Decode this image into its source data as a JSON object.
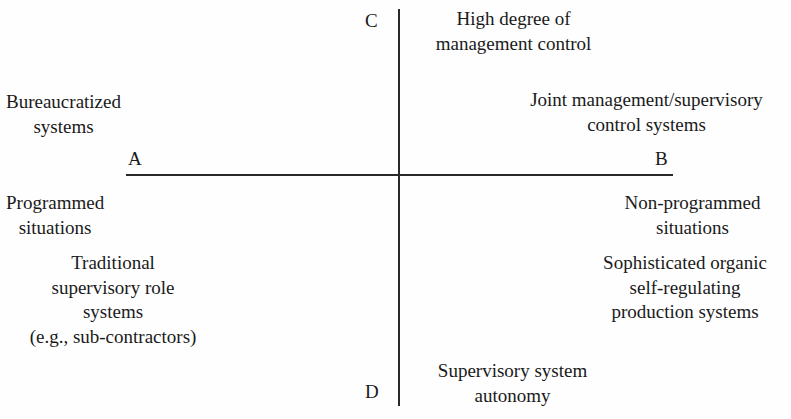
{
  "figure": {
    "type": "two-by-two-matrix-diagram",
    "axes": {
      "vertical": {
        "top_letter": "C",
        "bottom_letter": "D",
        "top_label_lines": [
          "High degree of",
          "management control"
        ],
        "bottom_label_lines": [
          "Supervisory system",
          "autonomy"
        ]
      },
      "horizontal": {
        "left_letter": "A",
        "right_letter": "B",
        "left_label_lines": [
          "Programmed",
          "situations"
        ],
        "right_label_lines": [
          "Non-programmed",
          "situations"
        ]
      }
    },
    "quadrants": {
      "top_left": {
        "lines": [
          "Bureaucratized",
          "systems"
        ]
      },
      "top_right": {
        "lines": [
          "Joint management/supervisory",
          "control systems"
        ]
      },
      "bottom_left": {
        "lines": [
          "Traditional",
          "supervisory role",
          "systems",
          "(e.g., sub-contractors)"
        ]
      },
      "bottom_right": {
        "lines": [
          "Sophisticated organic",
          "self-regulating",
          "production systems"
        ]
      }
    },
    "colors": {
      "background": "#fefefe",
      "axis_line": "#2a2a2a",
      "text": "#1a1a1a"
    }
  }
}
